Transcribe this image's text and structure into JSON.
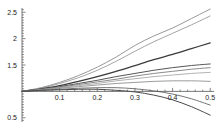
{
  "chart_data": {
    "type": "line",
    "title": "",
    "subtitle": "",
    "xlabel": "",
    "ylabel": "",
    "xlim": [
      0.0,
      0.51
    ],
    "ylim": [
      0.42,
      2.58
    ],
    "grid": false,
    "legend": null,
    "axis_origin": [
      0.0,
      1.0
    ],
    "x_ticks": [
      0.1,
      0.2,
      0.3,
      0.4,
      0.5
    ],
    "x_tick_labels": [
      "0.1",
      "0.2",
      "0.3",
      "0.4",
      "0.5"
    ],
    "y_ticks": [
      0.5,
      1.5,
      2.0,
      2.5
    ],
    "y_tick_labels": [
      "0.5",
      "1.5",
      "2",
      "2.5"
    ],
    "x": [
      0.0,
      0.05,
      0.1,
      0.15,
      0.2,
      0.25,
      0.3,
      0.35,
      0.4,
      0.45,
      0.5
    ],
    "series": [
      {
        "name": "curve-1",
        "color": "#8c8c8c",
        "width": 0.9,
        "values": [
          1.0,
          1.07,
          1.17,
          1.3,
          1.46,
          1.65,
          1.87,
          2.05,
          2.2,
          2.38,
          2.56
        ]
      },
      {
        "name": "curve-2",
        "color": "#9a9a9a",
        "width": 0.9,
        "values": [
          1.0,
          1.06,
          1.15,
          1.26,
          1.4,
          1.57,
          1.76,
          1.94,
          2.1,
          2.26,
          2.43
        ]
      },
      {
        "name": "curve-3",
        "color": "#3a3a3a",
        "width": 1.25,
        "values": [
          1.0,
          1.05,
          1.11,
          1.19,
          1.28,
          1.38,
          1.49,
          1.6,
          1.7,
          1.81,
          1.92
        ]
      },
      {
        "name": "curve-4",
        "color": "#555555",
        "width": 1.0,
        "values": [
          1.0,
          1.04,
          1.09,
          1.15,
          1.21,
          1.28,
          1.34,
          1.4,
          1.45,
          1.49,
          1.52
        ]
      },
      {
        "name": "curve-5",
        "color": "#7d7d7d",
        "width": 0.9,
        "values": [
          1.0,
          1.04,
          1.08,
          1.13,
          1.18,
          1.23,
          1.29,
          1.34,
          1.38,
          1.42,
          1.45
        ]
      },
      {
        "name": "curve-6",
        "color": "#a8a8a8",
        "width": 0.9,
        "values": [
          1.0,
          1.03,
          1.07,
          1.11,
          1.15,
          1.2,
          1.24,
          1.28,
          1.31,
          1.34,
          1.36
        ]
      },
      {
        "name": "curve-7",
        "color": "#8f8f8f",
        "width": 0.9,
        "values": [
          1.0,
          1.03,
          1.06,
          1.09,
          1.12,
          1.15,
          1.17,
          1.19,
          1.2,
          1.2,
          1.19
        ]
      },
      {
        "name": "curve-8",
        "color": "#6e6e6e",
        "width": 0.95,
        "values": [
          1.0,
          1.02,
          1.04,
          1.06,
          1.07,
          1.07,
          1.05,
          1.01,
          0.95,
          0.86,
          0.74
        ]
      },
      {
        "name": "curve-9",
        "color": "#4a4a4a",
        "width": 1.0,
        "values": [
          1.0,
          1.02,
          1.03,
          1.04,
          1.04,
          1.02,
          0.99,
          0.93,
          0.84,
          0.71,
          0.55
        ]
      }
    ]
  },
  "axes": {
    "axis_color": "#555555",
    "tick_color": "#555555",
    "label_color": "#1a1a1a"
  }
}
